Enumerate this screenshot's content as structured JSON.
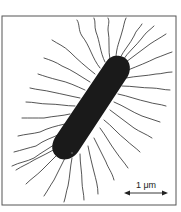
{
  "figure": {
    "scale_bar": {
      "label": "1 μm"
    },
    "colors": {
      "cell": "#1a1a1a",
      "flagella": "#2a2a2a",
      "frame": "#555555"
    }
  }
}
